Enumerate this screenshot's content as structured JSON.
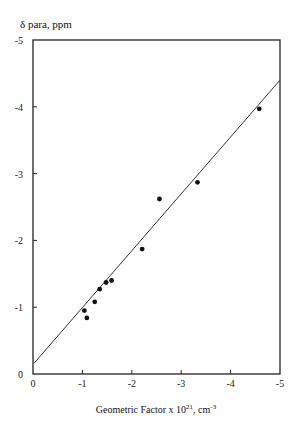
{
  "chart_data": {
    "type": "scatter",
    "title": "",
    "xlabel": "Geometric Factor x 10^21, cm^-3",
    "xlabel_main": "Geometric Factor x 10",
    "xlabel_sup1": "21",
    "xlabel_mid": ", cm",
    "xlabel_sup2": "-3",
    "ylabel": "δ para, ppm",
    "xlim": [
      0,
      -5
    ],
    "ylim": [
      0,
      -5
    ],
    "xticks": [
      "0",
      "-1",
      "-2",
      "-3",
      "-4",
      "-5"
    ],
    "yticks": [
      "0",
      "-1",
      "-2",
      "-3",
      "-4",
      "-5"
    ],
    "grid": false,
    "legend": null,
    "series": [
      {
        "name": "data",
        "marker": "filled-circle",
        "points": [
          {
            "x": -1.04,
            "y": -0.95
          },
          {
            "x": -1.09,
            "y": -0.84
          },
          {
            "x": -1.25,
            "y": -1.08
          },
          {
            "x": -1.35,
            "y": -1.27
          },
          {
            "x": -1.48,
            "y": -1.37
          },
          {
            "x": -1.59,
            "y": -1.4
          },
          {
            "x": -2.21,
            "y": -1.87
          },
          {
            "x": -2.56,
            "y": -2.62
          },
          {
            "x": -3.33,
            "y": -2.87
          },
          {
            "x": -4.58,
            "y": -3.97
          }
        ]
      }
    ],
    "fit_line": {
      "x0": 0,
      "y0": -0.16,
      "x1": -5,
      "y1": -4.4
    }
  }
}
